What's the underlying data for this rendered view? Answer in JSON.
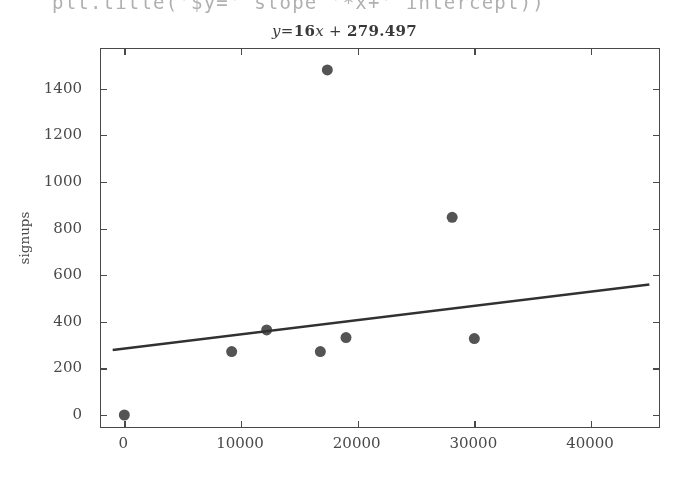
{
  "code_line": {
    "text": "plt.title('$y=' slope '*x+' intercept))"
  },
  "chart_data": {
    "type": "scatter",
    "title_parts": {
      "lhs": "y",
      "eq": "=",
      "slope": "16",
      "x": "x",
      "plus": "+",
      "intercept": "279.497"
    },
    "xlabel": "",
    "ylabel": "signups",
    "xlim": [
      -2000,
      46000
    ],
    "ylim": [
      -60,
      1570
    ],
    "xticks": [
      0,
      10000,
      20000,
      30000,
      40000
    ],
    "yticks": [
      0,
      200,
      400,
      600,
      800,
      1000,
      1200,
      1400
    ],
    "xticklabels": [
      "0",
      "10000",
      "20000",
      "30000",
      "40000"
    ],
    "yticklabels": [
      "0",
      "200",
      "400",
      "600",
      "800",
      "1000",
      "1200",
      "1400"
    ],
    "grid": false,
    "legend": null,
    "series": [
      {
        "name": "signups",
        "type": "scatter",
        "marker": "circle",
        "color": "#555555",
        "size": 11,
        "points": [
          {
            "x": 0,
            "y": 0
          },
          {
            "x": 9200,
            "y": 272
          },
          {
            "x": 12200,
            "y": 365
          },
          {
            "x": 16800,
            "y": 272
          },
          {
            "x": 17400,
            "y": 1480
          },
          {
            "x": 19000,
            "y": 332
          },
          {
            "x": 28100,
            "y": 848
          },
          {
            "x": 30000,
            "y": 328
          }
        ]
      },
      {
        "name": "fit-line",
        "type": "line",
        "color": "#333333",
        "equation": "y = 16x + 279.497",
        "slope": 16,
        "intercept": 279.497,
        "endpoints": [
          {
            "x": -1000,
            "y": 279
          },
          {
            "x": 45000,
            "y": 560
          }
        ]
      }
    ]
  }
}
